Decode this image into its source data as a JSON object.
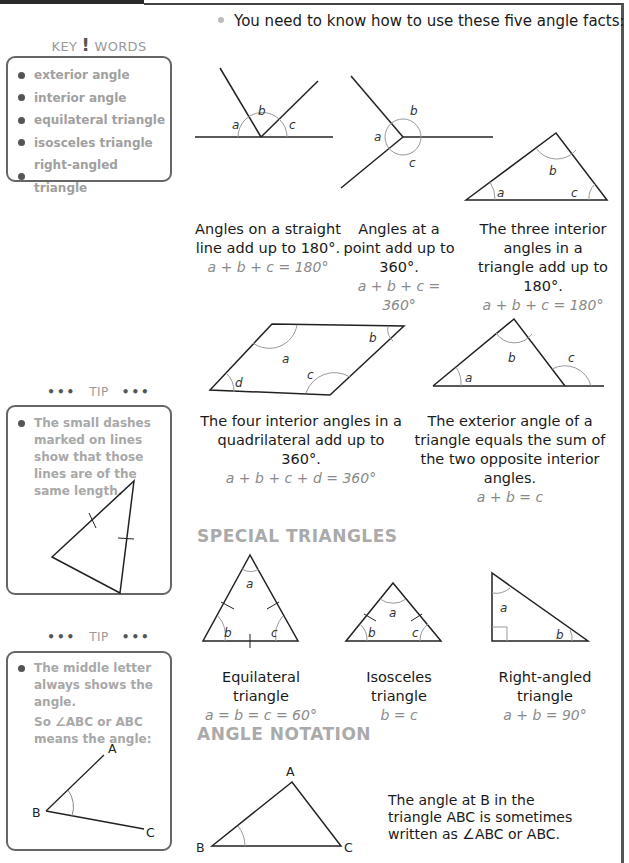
{
  "key_words": {
    "title_left": "KEY",
    "title_bang": "!",
    "title_right": "WORDS",
    "items": [
      {
        "label": "exterior angle"
      },
      {
        "label": "interior angle"
      },
      {
        "label": "equilateral triangle"
      },
      {
        "label": "isosceles triangle"
      },
      {
        "label": "right-angled triangle"
      }
    ]
  },
  "tips": [
    {
      "title": "TIP",
      "dots": "•••",
      "text": "The small dashes marked on lines show that those lines are of the same length."
    },
    {
      "title": "TIP",
      "dots": "•••",
      "text": "The middle letter always shows the angle.",
      "text2": "So ∠ABC or ABC means the angle:",
      "labels": {
        "A": "A",
        "B": "B",
        "C": "C"
      }
    }
  ],
  "intro": "You need to know how to use these five angle facts:",
  "facts": [
    {
      "caption": "Angles on a straight line add up to 180°.",
      "equation": "a + b + c = 180°",
      "labels": [
        "a",
        "b",
        "c"
      ]
    },
    {
      "caption": "Angles at a point add up to 360°.",
      "equation": "a + b + c = 360°",
      "labels": [
        "a",
        "b",
        "c"
      ]
    },
    {
      "caption": "The three interior angles in a triangle add up to 180°.",
      "equation": "a + b + c = 180°",
      "labels": [
        "a",
        "b",
        "c"
      ]
    },
    {
      "caption": "The four interior angles in a quadrilateral add up to 360°.",
      "equation": "a + b + c + d  = 360°",
      "labels": [
        "a",
        "b",
        "c",
        "d"
      ]
    },
    {
      "caption": "The exterior angle of a triangle equals the sum of the two opposite interior angles.",
      "equation": "a + b = c",
      "labels": [
        "a",
        "b",
        "c"
      ]
    }
  ],
  "special_triangles": {
    "heading": "SPECIAL TRIANGLES",
    "items": [
      {
        "name": "Equilateral triangle",
        "equation": "a = b = c = 60°",
        "labels": [
          "a",
          "b",
          "c"
        ]
      },
      {
        "name": "Isosceles triangle",
        "equation": "b = c",
        "labels": [
          "a",
          "b",
          "c"
        ]
      },
      {
        "name": "Right-angled triangle",
        "equation": "a + b = 90°",
        "labels": [
          "a",
          "b"
        ]
      }
    ]
  },
  "angle_notation": {
    "heading": "ANGLE NOTATION",
    "vertex_labels": {
      "A": "A",
      "B": "B",
      "C": "C"
    },
    "text": "The angle at B in the triangle ABC is sometimes written as ∠ABC or ABC."
  }
}
